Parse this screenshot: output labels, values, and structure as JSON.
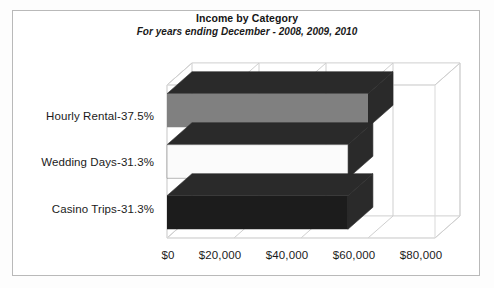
{
  "chart_data": {
    "type": "bar",
    "orientation": "horizontal",
    "style": "3d",
    "title": "Income by Category",
    "subtitle": "For years ending December - 2008, 2009, 2010",
    "xlabel": "",
    "ylabel": "",
    "categories": [
      "Hourly Rental-37.5%",
      "Wedding Days-31.3%",
      "Casino Trips-31.3%"
    ],
    "values": [
      60000,
      54000,
      54000
    ],
    "series": [
      {
        "name": "Income",
        "values": [
          60000,
          54000,
          54000
        ]
      }
    ],
    "bar_colors": [
      "#808080",
      "#fbfbfb",
      "#1c1c1c"
    ],
    "bar_side_color": "#2a2a2a",
    "bar_top_color": "#2a2a2a",
    "xlim": [
      0,
      80000
    ],
    "xticks": [
      0,
      20000,
      40000,
      60000,
      80000
    ],
    "xticklabels": [
      "$0",
      "$20,000",
      "$40,000",
      "$60,000",
      "$80,000"
    ],
    "grid": true,
    "legend": "none",
    "annotations": []
  },
  "figure": {
    "title": "Income by Category",
    "subtitle": "For years ending December - 2008, 2009, 2010",
    "border_color": "#b9b9b9",
    "background": "#ffffff"
  },
  "axis": {
    "tick_labels": [
      "$0",
      "$20,000",
      "$40,000",
      "$60,000",
      "$80,000"
    ]
  },
  "categories": {
    "labels": [
      "Hourly Rental-37.5%",
      "Wedding Days-31.3%",
      "Casino Trips-31.3%"
    ]
  }
}
